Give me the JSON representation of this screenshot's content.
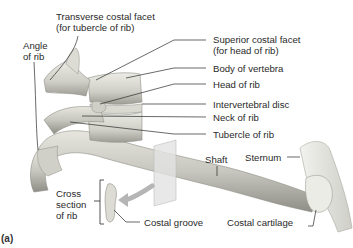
{
  "figure": {
    "panel_label": "(a)",
    "colors": {
      "bone_light": "#e4e4dc",
      "bone_mid": "#c9c9c0",
      "bone_dark": "#8f8f88",
      "line": "#2a2a2a",
      "plane": "#d8d8d8",
      "arrow": "#b8b8b8"
    },
    "labels": {
      "transverse_costal_facet": {
        "line1": "Transverse costal facet",
        "line2": "(for tubercle of rib)"
      },
      "angle_of_rib": {
        "line1": "Angle",
        "line2": "of rib"
      },
      "superior_costal_facet": {
        "line1": "Superior costal facet",
        "line2": "(for head of rib)"
      },
      "body_of_vertebra": "Body of vertebra",
      "head_of_rib": "Head of rib",
      "intervertebral_disc": "Intervertebral disc",
      "neck_of_rib": "Neck of rib",
      "tubercle_of_rib": "Tubercle of rib",
      "shaft": "Shaft",
      "sternum": "Sternum",
      "cross_section": {
        "line1": "Cross",
        "line2": "section",
        "line3": "of rib"
      },
      "costal_groove": "Costal groove",
      "costal_cartilage": "Costal cartilage"
    }
  }
}
